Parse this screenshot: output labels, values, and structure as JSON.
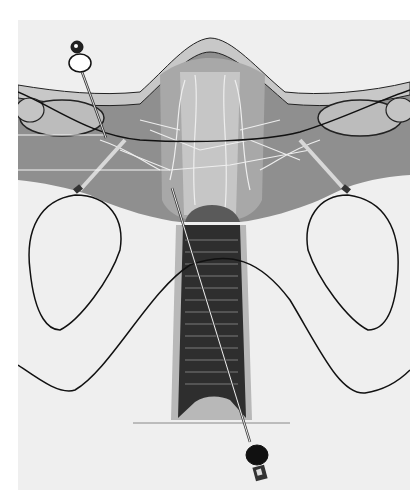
{
  "image": {
    "subject": "anatomical illustration",
    "description": "Grayscale medical illustration of a uterus and vagina cross-section with two needles, one inserted from upper left into the broad ligament and one passing diagonally from the vaginal opening upward",
    "colors": {
      "background": "#ffffff",
      "panel": "#efefef",
      "tissue_mid": "#8a8a8a",
      "tissue_light": "#bdbdbd",
      "vagina_dark": "#2a2a2a",
      "outline": "#111111",
      "vessel": "#e8e8e8"
    }
  }
}
